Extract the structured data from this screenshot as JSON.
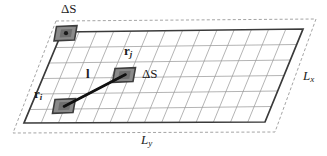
{
  "figure": {
    "background_color": "#ffffff",
    "line_color": "#3a3a3a",
    "grid_color": "#8c8c8c",
    "patch_fill": "#8f8f8f",
    "patch_edge": "#3d3d3d",
    "vector_color": "#111111",
    "dashed_border_color": "#9a9a9a",
    "grid": {
      "rows": 6,
      "cols": 14
    },
    "labels": {
      "delta_s_top": {
        "symbol": "ΔS",
        "role": "area-element-top-left"
      },
      "delta_s_mid": {
        "symbol": "ΔS",
        "role": "area-element-middle"
      },
      "r_j": {
        "base": "r",
        "subscript": "j",
        "role": "position-vector-j"
      },
      "r_i": {
        "base": "r",
        "subscript": "i",
        "role": "position-vector-i"
      },
      "l": {
        "base": "l",
        "role": "separation-vector"
      },
      "L_x": {
        "base": "L",
        "subscript": "x",
        "role": "edge-length-x"
      },
      "L_y": {
        "base": "L",
        "subscript": "y",
        "role": "edge-length-y"
      }
    },
    "geometry": {
      "solid_quad": [
        [
          62,
          32
        ],
        [
          303,
          29
        ],
        [
          265,
          122
        ],
        [
          24,
          123
        ]
      ],
      "dashed_quad": [
        [
          56,
          21
        ],
        [
          316,
          19
        ],
        [
          275,
          132
        ],
        [
          13,
          133
        ]
      ],
      "patch_top_left": {
        "center": [
          66,
          34
        ],
        "has_dot": true
      },
      "patch_middle": {
        "center": [
          124,
          75
        ],
        "has_dot": false
      },
      "patch_lower": {
        "center": [
          64,
          106
        ],
        "has_dot": false
      },
      "vector_from": [
        64,
        106
      ],
      "vector_to": [
        124,
        75
      ]
    }
  }
}
